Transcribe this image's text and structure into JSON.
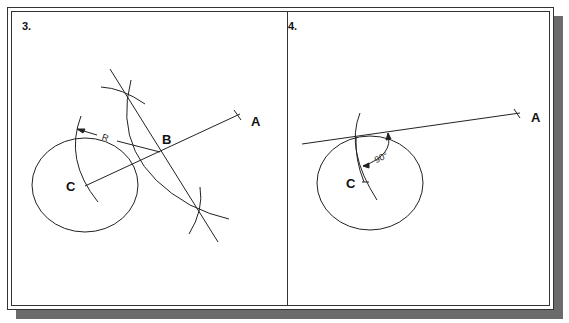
{
  "panels": [
    {
      "step_label": "3.",
      "points": {
        "center": "C",
        "external": "A",
        "midpoint": "B"
      },
      "dimension_label": "R"
    },
    {
      "step_label": "4.",
      "points": {
        "center": "C",
        "external": "A"
      },
      "angle_label": "90°"
    }
  ],
  "colors": {
    "line": "#222222",
    "shadow": "#6b6b6b",
    "background": "#ffffff"
  }
}
